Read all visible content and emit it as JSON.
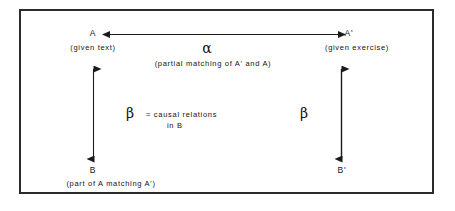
{
  "diagram": {
    "type": "commutative-square",
    "background": "#ffffff",
    "border_color": "#2b2b2b",
    "stroke_color": "#1a1a1a",
    "nodes": {
      "top_left": {
        "symbol": "A",
        "caption": "(given text)"
      },
      "top_right": {
        "symbol": "A'",
        "caption": "(given exercise)"
      },
      "bottom_left": {
        "symbol": "B",
        "caption": "(part of A matching A')"
      },
      "bottom_right": {
        "symbol": "B'",
        "caption": ""
      }
    },
    "edges": {
      "horizontal": {
        "label": "α",
        "caption": "(partial matching of A' and A)",
        "heads": "double"
      },
      "left_vertical": {
        "label": "β",
        "caption_line1": "=  causal  relations",
        "caption_line2": "in B",
        "heads": "double"
      },
      "right_vertical": {
        "label": "β",
        "heads": "double"
      }
    }
  }
}
